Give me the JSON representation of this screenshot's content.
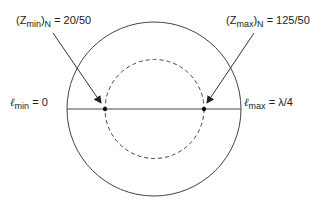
{
  "diagram": {
    "type": "smith-chart-sketch",
    "labels": {
      "zmin": {
        "prefix": "(Z",
        "sub": "min",
        "mid": ")",
        "sub2": "N",
        "value": " = 20/50"
      },
      "zmax": {
        "prefix": "(Z",
        "sub": "max",
        "mid": ")",
        "sub2": "N",
        "value": " = 125/50"
      },
      "lmin": {
        "symbol": "ℓ",
        "sub": "min",
        "value": " = 0"
      },
      "lmax": {
        "symbol": "ℓ",
        "sub": "max",
        "value": " = λ/4"
      }
    },
    "colors": {
      "stroke": "#333333",
      "text": "#222222"
    }
  }
}
